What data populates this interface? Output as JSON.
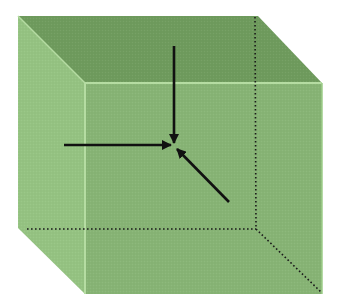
{
  "diagram": {
    "title": "",
    "colors": {
      "background": "#ffffff",
      "top_face": "#6f9b5d",
      "left_face": "#95c382",
      "front_face": "#87b475",
      "edge_highlight": "#b5dca2",
      "arrow": "#111111",
      "hidden_edge": "#1a1a1a"
    },
    "cube": {
      "back_top_left": [
        18,
        16
      ],
      "back_top_right": [
        258,
        16
      ],
      "front_top_left": [
        85,
        83
      ],
      "front_top_right": [
        322,
        83
      ],
      "back_bottom_left": [
        18,
        228
      ],
      "front_bottom_left": [
        85,
        294
      ],
      "front_bottom_right": [
        322,
        294
      ],
      "hidden_corner": [
        256,
        229
      ]
    },
    "center_point": [
      174,
      146
    ],
    "arrows": [
      {
        "name": "arrow-from-top",
        "from": [
          174,
          46
        ],
        "to": [
          174,
          143
        ]
      },
      {
        "name": "arrow-from-left",
        "from": [
          64,
          145
        ],
        "to": [
          171,
          145
        ]
      },
      {
        "name": "arrow-from-bottom-right",
        "from": [
          229,
          202
        ],
        "to": [
          177,
          149
        ]
      }
    ]
  }
}
